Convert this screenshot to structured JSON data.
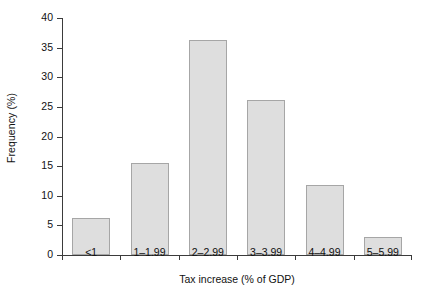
{
  "chart_data": {
    "type": "bar",
    "title": "",
    "subtitle": "",
    "xlabel": "Tax increase (% of GDP)",
    "ylabel": "Frequency (%)",
    "categories": [
      "<1",
      "1–1.99",
      "2–2.99",
      "3–3.99",
      "4–4.99",
      "5–5.99"
    ],
    "values": [
      6.3,
      15.5,
      36.3,
      26.1,
      11.8,
      3.0
    ],
    "ylim": [
      0,
      40
    ],
    "yticks": [
      0,
      5,
      10,
      15,
      20,
      25,
      30,
      35,
      40
    ],
    "ytick_labels": [
      "0",
      "5",
      "10",
      "15",
      "20",
      "25",
      "30",
      "35",
      "40"
    ],
    "grid": false,
    "legend": null,
    "annotations": [],
    "bar_fill_color": "#dedede",
    "bar_edge_color": "#a6a6a6",
    "axis_color": "#3b3b3b",
    "background_color": "#ffffff"
  }
}
